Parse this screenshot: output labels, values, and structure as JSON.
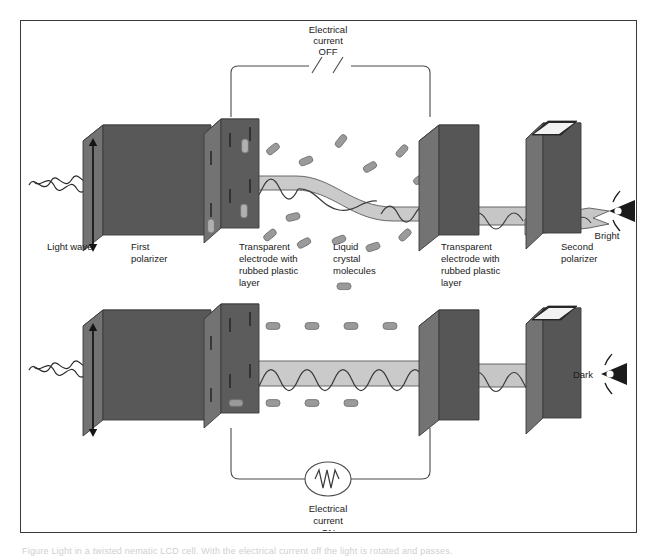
{
  "figure": {
    "border_color": "#3a3a3a",
    "background": "#ffffff"
  },
  "colors": {
    "panel_face": "#585858",
    "panel_top": "#8d8d8d",
    "panel_side": "#6f6f6f",
    "beam_fill": "#b9b9b9",
    "beam_stroke": "#4a4a4a",
    "wave_stroke": "#3c3c3c",
    "molecule_fill": "#9a9a9a",
    "molecule_stroke": "#6a6a6a",
    "wire": "#4a4a4a",
    "text": "#1a1a1a"
  },
  "panels": {
    "top": {
      "name": "Electrical current OFF state — light passes, display appears bright",
      "circuit": {
        "label_line1": "Electrical",
        "label_line2": "current",
        "label_line3": "OFF",
        "state": "open",
        "icon": "broken-circuit-slashes"
      },
      "output": {
        "label": "Bright",
        "icon": "eye-icon"
      },
      "light_wave_twists": true,
      "molecule_arrangement": "twisted / randomly oriented"
    },
    "bottom": {
      "name": "Electrical current ON state — light blocked, display appears dark",
      "circuit": {
        "label_line1": "Electrical",
        "label_line2": "current",
        "label_line3": "ON",
        "state": "closed",
        "icon": "ac-source-zigzag"
      },
      "output": {
        "label": "Dark",
        "icon": "eye-icon"
      },
      "light_wave_twists": false,
      "molecule_arrangement": "aligned horizontally with field"
    }
  },
  "legend_labels": [
    {
      "id": "light-wave",
      "lines": [
        "Light wave"
      ],
      "x": 26,
      "swatch": false
    },
    {
      "id": "first-polarizer",
      "lines": [
        "First",
        "polarizer"
      ],
      "x": 110,
      "swatch": false
    },
    {
      "id": "left-electrode",
      "lines": [
        "Transparent",
        "electrode with",
        "rubbed plastic",
        "layer"
      ],
      "x": 218,
      "swatch": false
    },
    {
      "id": "liquid-crystal",
      "lines": [
        "Liquid",
        "crystal",
        "molecules"
      ],
      "x": 312,
      "swatch": true
    },
    {
      "id": "right-electrode",
      "lines": [
        "Transparent",
        "electrode with",
        "rubbed plastic",
        "layer"
      ],
      "x": 420,
      "swatch": false
    },
    {
      "id": "second-polarizer",
      "lines": [
        "Second",
        "polarizer"
      ],
      "x": 540,
      "swatch": false
    }
  ],
  "polarizer_axes": {
    "first": "vertical double-headed arrow",
    "second": "horizontal slot"
  },
  "caption": {
    "text": "Figure   Light in a twisted nematic LCD cell. With the electrical current off the light is rotated and passes."
  }
}
